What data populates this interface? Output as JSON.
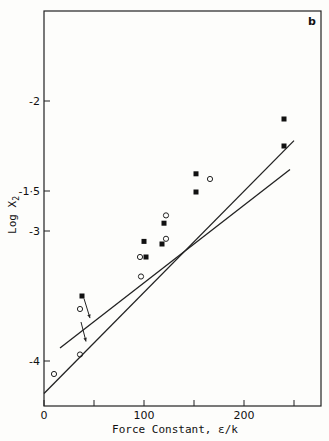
{
  "chart_data": {
    "type": "scatter",
    "title": "",
    "panel_label": "b",
    "xlabel": "Force Constant, ε/k",
    "ylabel": "Log X₂",
    "xlim": [
      0,
      275
    ],
    "ylim": [
      -4.3,
      -1.5
    ],
    "x_ticks": [
      0,
      50,
      100,
      150,
      200,
      250
    ],
    "x_tick_labels": [
      "0",
      "100",
      "200"
    ],
    "y_ticks": [
      -1.5,
      -2,
      -3,
      -4
    ],
    "y_tick_labels": [
      "-1·5",
      "-2",
      "-3",
      "-4"
    ],
    "grid": false,
    "series": [
      {
        "name": "filled squares",
        "marker": "square-filled",
        "points": [
          [
            38,
            -3.5
          ],
          [
            100,
            -3.08
          ],
          [
            102,
            -3.2
          ],
          [
            118,
            -3.1
          ],
          [
            120,
            -2.94
          ],
          [
            152,
            -2.56
          ],
          [
            152,
            -2.7
          ],
          [
            240,
            -1.75
          ],
          [
            240,
            -1.9
          ]
        ]
      },
      {
        "name": "open circles",
        "marker": "circle-open",
        "points": [
          [
            10,
            -4.1
          ],
          [
            36,
            -3.6
          ],
          [
            36,
            -3.95
          ],
          [
            96,
            -3.2
          ],
          [
            97,
            -3.35
          ],
          [
            122,
            -2.88
          ],
          [
            122,
            -3.06
          ],
          [
            166,
            -2.6
          ]
        ]
      },
      {
        "name": "upper fit line",
        "type": "line",
        "points": [
          [
            16,
            -3.9
          ],
          [
            246,
            -1.62
          ]
        ]
      },
      {
        "name": "lower fit line",
        "type": "line",
        "points": [
          [
            0,
            -4.25
          ],
          [
            250,
            -1.78
          ]
        ]
      }
    ],
    "annotations": [
      {
        "type": "arrow",
        "from": [
          40,
          -3.52
        ],
        "to": [
          46,
          -3.67
        ]
      },
      {
        "type": "arrow",
        "from": [
          37,
          -3.7
        ],
        "to": [
          42,
          -3.85
        ]
      }
    ]
  }
}
